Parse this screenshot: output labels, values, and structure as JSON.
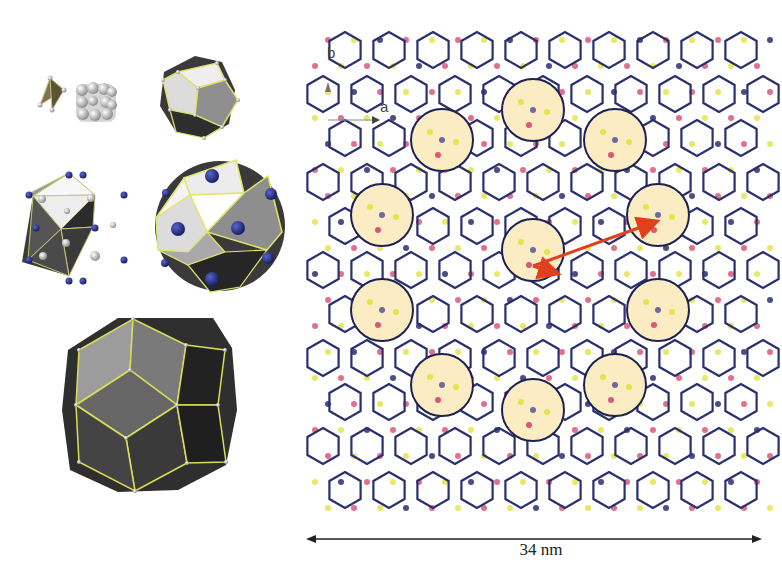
{
  "figure": {
    "left_panel": {
      "clusters": [
        {
          "name": "tetrahedron",
          "description": "small tetrahedron with space-filling atom cluster"
        },
        {
          "name": "dodecahedron",
          "description": "pentagonal dodecahedron"
        },
        {
          "name": "icosahedron",
          "description": "icosahedron with blue vertex atoms"
        },
        {
          "name": "icosidodecahedron-like",
          "description": "polyhedron with blue atoms in faces"
        },
        {
          "name": "large-polyhedron",
          "description": "large polyhedron with yellow edges"
        }
      ]
    },
    "right_panel": {
      "axis_labels": {
        "a": "a",
        "b": "b"
      },
      "scale_bar": {
        "label": "34 nm"
      },
      "colors": {
        "network": "#2a2f6e",
        "pink_site": "#d9587a",
        "yellow_site": "#e4e44c",
        "highlight_fill": "#fbecc4",
        "arrow": "#e0401c"
      },
      "highlight_circles": [
        {
          "cx": 142,
          "cy": 140
        },
        {
          "cx": 233,
          "cy": 110
        },
        {
          "cx": 315,
          "cy": 140
        },
        {
          "cx": 82,
          "cy": 215
        },
        {
          "cx": 358,
          "cy": 215
        },
        {
          "cx": 233,
          "cy": 250
        },
        {
          "cx": 82,
          "cy": 310
        },
        {
          "cx": 358,
          "cy": 310
        },
        {
          "cx": 142,
          "cy": 385
        },
        {
          "cx": 233,
          "cy": 410
        },
        {
          "cx": 315,
          "cy": 385
        }
      ],
      "highlight_radius": 31
    }
  }
}
